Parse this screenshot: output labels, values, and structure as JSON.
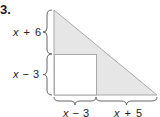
{
  "problem": {
    "number": "3.",
    "figure": {
      "shape": "right-triangle-with-inscribed-square",
      "colors": {
        "triangle_fill": "#e6e6e6",
        "triangle_stroke": "#a8a8a8",
        "square_fill": "#ffffff",
        "brace_stroke": "#555555"
      },
      "labels": {
        "left_upper": {
          "var": "x",
          "op": "+",
          "num": "6"
        },
        "left_lower": {
          "var": "x",
          "op": "−",
          "num": "3"
        },
        "bottom_left": {
          "var": "x",
          "op": "−",
          "num": "3"
        },
        "bottom_right": {
          "var": "x",
          "op": "+",
          "num": "5"
        }
      }
    }
  }
}
